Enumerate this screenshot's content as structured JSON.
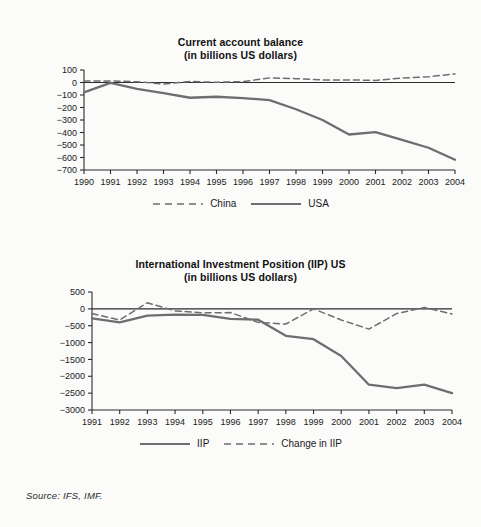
{
  "figure": {
    "background_color": "#fbfbfa",
    "line_color": "#6e6e6e",
    "axis_color": "#2b2b2b",
    "text_color": "#1a1a1a"
  },
  "source_note": "Source: IFS, IMF.",
  "chart_data": [
    {
      "id": "current-account-balance",
      "type": "line",
      "title": "Current account balance",
      "subtitle": "(in billions US dollars)",
      "xlabel": "",
      "ylabel": "",
      "grid": false,
      "legend_position": "bottom",
      "ylim": [
        -700,
        100
      ],
      "yticks": [
        100,
        0,
        -100,
        -200,
        -300,
        -400,
        -500,
        -600,
        -700
      ],
      "ytick_labels": [
        "100",
        "0",
        "−100",
        "−200",
        "−300",
        "−400",
        "−500",
        "−600",
        "−700"
      ],
      "categories": [
        "1990",
        "1991",
        "1992",
        "1993",
        "1994",
        "1995",
        "1996",
        "1997",
        "1998",
        "1999",
        "2000",
        "2001",
        "2002",
        "2003",
        "2004"
      ],
      "x": [
        1990,
        1991,
        1992,
        1993,
        1994,
        1995,
        1996,
        1997,
        1998,
        1999,
        2000,
        2001,
        2002,
        2003,
        2004
      ],
      "series": [
        {
          "name": "China",
          "style": "dashed",
          "color": "#6e6e6e",
          "values": [
            12,
            13,
            6,
            -12,
            8,
            2,
            7,
            37,
            31,
            21,
            21,
            17,
            35,
            46,
            69
          ]
        },
        {
          "name": "USA",
          "style": "solid",
          "color": "#6e6e6e",
          "values": [
            -79,
            -3,
            -51,
            -85,
            -122,
            -114,
            -125,
            -141,
            -214,
            -300,
            -416,
            -397,
            -459,
            -522,
            -618
          ]
        }
      ]
    },
    {
      "id": "international-investment-position",
      "type": "line",
      "title": "International Investment Position (IIP) US",
      "subtitle": "(in billions US dollars)",
      "xlabel": "",
      "ylabel": "",
      "grid": false,
      "legend_position": "bottom",
      "ylim": [
        -3000,
        500
      ],
      "yticks": [
        500,
        0,
        -500,
        -1000,
        -1500,
        -2000,
        -2500,
        -3000
      ],
      "ytick_labels": [
        "500",
        "0",
        "−500",
        "−1000",
        "−1500",
        "−2000",
        "−2500",
        "−3000"
      ],
      "categories": [
        "1991",
        "1992",
        "1993",
        "1994",
        "1995",
        "1996",
        "1997",
        "1998",
        "1999",
        "2000",
        "2001",
        "2002",
        "2003",
        "2004"
      ],
      "x": [
        1991,
        1992,
        1993,
        1994,
        1995,
        1996,
        1997,
        1998,
        1999,
        2000,
        2001,
        2002,
        2003,
        2004
      ],
      "series": [
        {
          "name": "IIP",
          "style": "solid",
          "color": "#6e6e6e",
          "values": [
            -280,
            -400,
            -200,
            -170,
            -180,
            -300,
            -320,
            -800,
            -900,
            -1400,
            -2250,
            -2350,
            -2250,
            -2500
          ]
        },
        {
          "name": "Change in IIP",
          "style": "dashed",
          "color": "#6e6e6e",
          "values": [
            -140,
            -330,
            180,
            -60,
            -120,
            -110,
            -400,
            -450,
            0,
            -330,
            -600,
            -140,
            40,
            -150
          ]
        }
      ]
    }
  ]
}
